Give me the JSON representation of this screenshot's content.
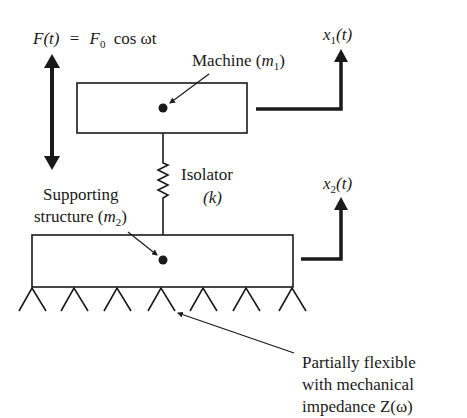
{
  "diagram": {
    "type": "two-mass vibration isolation system",
    "force": {
      "label_lhs": "F(t)",
      "label_eq": "=",
      "label_f0": "F",
      "label_f0_sub": "0",
      "label_rhs": "cos ωt"
    },
    "machine": {
      "label": "Machine (",
      "mass_symbol": "m",
      "mass_sub": "1",
      "close": ")"
    },
    "isolator": {
      "label": "Isolator",
      "stiffness": "(k)"
    },
    "support": {
      "label_line1": "Supporting",
      "label_line2": "structure (",
      "mass_symbol": "m",
      "mass_sub": "2",
      "close": ")"
    },
    "displacement1": {
      "symbol": "x",
      "sub": "1",
      "arg": "(t)"
    },
    "displacement2": {
      "symbol": "x",
      "sub": "2",
      "arg": "(t)"
    },
    "foundation": {
      "line1": "Partially flexible",
      "line2": "with mechanical",
      "line3": "impedance Z(ω)"
    },
    "colors": {
      "ink": "#1a1a1a",
      "background": "#ffffff"
    }
  }
}
